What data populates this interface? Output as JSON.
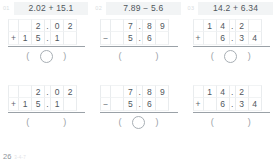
{
  "footer": {
    "page_number": "26",
    "note": "3-4-7"
  },
  "answer_paren": {
    "left": "(",
    "right": ")"
  },
  "problems": [
    {
      "index": "01",
      "expression": "2.02 + 15.1",
      "rows": [
        {
          "op": "",
          "cells": [
            "",
            "2",
            ".",
            "0",
            "2"
          ]
        },
        {
          "op": "+",
          "cells": [
            "1",
            "5",
            ".",
            "1",
            ""
          ]
        }
      ],
      "has_circle": true
    },
    {
      "index": "02",
      "expression": "7.89 − 5.6",
      "rows": [
        {
          "op": "",
          "cells": [
            "",
            "7",
            ".",
            "8",
            "9"
          ]
        },
        {
          "op": "−",
          "cells": [
            "",
            "5",
            ".",
            "6",
            ""
          ]
        }
      ],
      "has_circle": false
    },
    {
      "index": "03",
      "expression": "14.2 + 6.34",
      "rows": [
        {
          "op": "",
          "cells": [
            "1",
            "4",
            ".",
            "2",
            ""
          ]
        },
        {
          "op": "+",
          "cells": [
            "",
            "6",
            ".",
            "3",
            "4"
          ]
        }
      ],
      "has_circle": true
    },
    {
      "index": "",
      "expression": "",
      "rows": [
        {
          "op": "",
          "cells": [
            "",
            "2",
            ".",
            "0",
            "2"
          ]
        },
        {
          "op": "+",
          "cells": [
            "1",
            "5",
            ".",
            "1",
            ""
          ]
        }
      ],
      "has_circle": false
    },
    {
      "index": "",
      "expression": "",
      "rows": [
        {
          "op": "",
          "cells": [
            "",
            "7",
            ".",
            "8",
            "9"
          ]
        },
        {
          "op": "−",
          "cells": [
            "",
            "5",
            ".",
            "6",
            ""
          ]
        }
      ],
      "has_circle": true
    },
    {
      "index": "",
      "expression": "",
      "rows": [
        {
          "op": "",
          "cells": [
            "1",
            "4",
            ".",
            "2",
            ""
          ]
        },
        {
          "op": "+",
          "cells": [
            "",
            "6",
            ".",
            "3",
            "4"
          ]
        }
      ],
      "has_circle": false
    }
  ]
}
